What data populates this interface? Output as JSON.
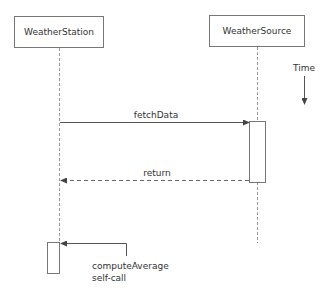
{
  "diagram": {
    "type": "sequence",
    "participants": [
      {
        "name": "WeatherStation"
      },
      {
        "name": "WeatherSource"
      }
    ],
    "time_label": "Time",
    "messages": [
      {
        "label": "fetchData",
        "from": "WeatherStation",
        "to": "WeatherSource",
        "style": "solid"
      },
      {
        "label": "return",
        "from": "WeatherSource",
        "to": "WeatherStation",
        "style": "dashed"
      },
      {
        "label_line1": "computeAverage",
        "label_line2": "self-call",
        "from": "WeatherStation",
        "to": "WeatherStation",
        "style": "solid"
      }
    ],
    "colors": {
      "line": "#666666",
      "text": "#333333",
      "background": "#ffffff"
    }
  }
}
